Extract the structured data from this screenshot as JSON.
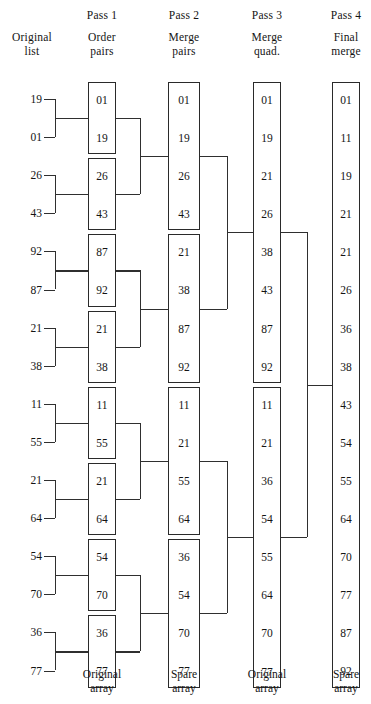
{
  "headers": {
    "original": {
      "line1": "Original",
      "line2": "list"
    },
    "pass1": {
      "pass": "Pass 1",
      "line1": "Order",
      "line2": "pairs"
    },
    "pass2": {
      "pass": "Pass 2",
      "line1": "Merge",
      "line2": "pairs"
    },
    "pass3": {
      "pass": "Pass 3",
      "line1": "Merge",
      "line2": "quad."
    },
    "pass4": {
      "pass": "Pass 4",
      "line1": "Final",
      "line2": "merge"
    }
  },
  "footers": {
    "pass1": {
      "line1": "Original",
      "line2": "array"
    },
    "pass2": {
      "line1": "Spare",
      "line2": "array"
    },
    "pass3": {
      "line1": "Original",
      "line2": "array"
    },
    "pass4": {
      "line1": "Spare",
      "line2": "array"
    }
  },
  "original_list": [
    "19",
    "01",
    "26",
    "43",
    "92",
    "87",
    "21",
    "38",
    "11",
    "55",
    "21",
    "64",
    "54",
    "70",
    "36",
    "77"
  ],
  "pass1_blocks": [
    [
      "01",
      "19"
    ],
    [
      "26",
      "43"
    ],
    [
      "87",
      "92"
    ],
    [
      "21",
      "38"
    ],
    [
      "11",
      "55"
    ],
    [
      "21",
      "64"
    ],
    [
      "54",
      "70"
    ],
    [
      "36",
      "77"
    ]
  ],
  "pass2_blocks": [
    [
      "01",
      "19",
      "26",
      "43"
    ],
    [
      "21",
      "38",
      "87",
      "92"
    ],
    [
      "11",
      "21",
      "55",
      "64"
    ],
    [
      "36",
      "54",
      "70",
      "77"
    ]
  ],
  "pass3_blocks": [
    [
      "01",
      "19",
      "21",
      "26",
      "38",
      "43",
      "87",
      "92"
    ],
    [
      "11",
      "21",
      "36",
      "54",
      "55",
      "64",
      "70",
      "77"
    ]
  ],
  "pass4_blocks": [
    [
      "01",
      "11",
      "19",
      "21",
      "21",
      "26",
      "36",
      "38",
      "43",
      "54",
      "55",
      "64",
      "70",
      "77",
      "87",
      "92"
    ]
  ],
  "colors": {
    "ink": "#141414",
    "line": "#2f2f2f",
    "border": "#2a2a2a",
    "background": "#ffffff"
  },
  "geometry": {
    "row_step": 38.1,
    "first_row_center": 99,
    "col_x": {
      "original": 30,
      "pass1": 88,
      "pass2": 168,
      "pass3": 253,
      "pass4": 332
    },
    "col_w": {
      "pass1": 28,
      "pass2": 32,
      "pass3": 28,
      "pass4": 28
    }
  }
}
